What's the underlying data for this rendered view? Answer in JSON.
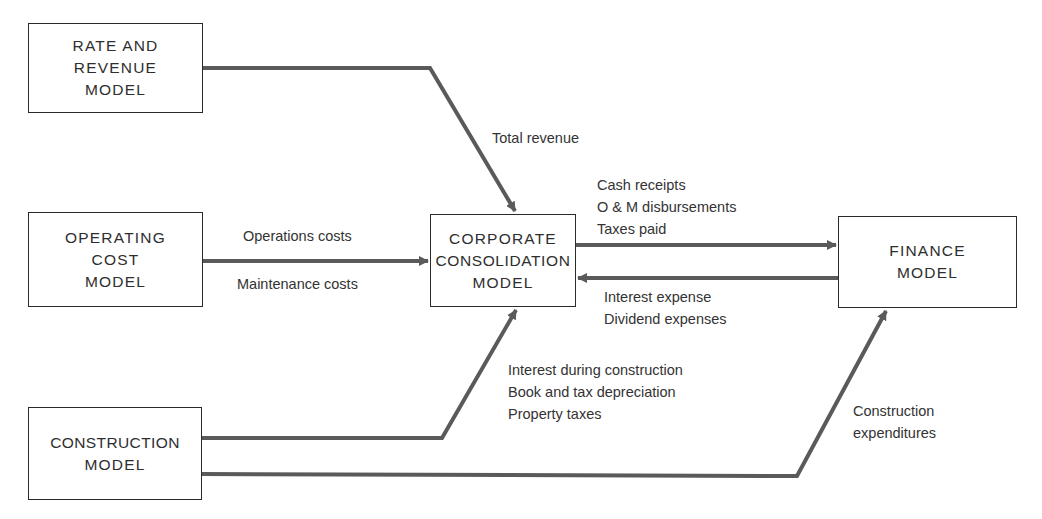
{
  "diagram": {
    "type": "flow",
    "nodes": [
      {
        "id": "rate_revenue",
        "lines": [
          "RATE AND",
          "REVENUE",
          "MODEL"
        ]
      },
      {
        "id": "operating_cost",
        "lines": [
          "OPERATING",
          "COST",
          "MODEL"
        ]
      },
      {
        "id": "corporate",
        "lines": [
          "CORPORATE",
          "CONSOLIDATION",
          "MODEL"
        ]
      },
      {
        "id": "finance",
        "lines": [
          "FINANCE",
          "MODEL"
        ]
      },
      {
        "id": "construction",
        "lines": [
          "CONSTRUCTION",
          "MODEL"
        ]
      }
    ],
    "edges": [
      {
        "from": "rate_revenue",
        "to": "corporate",
        "labels": [
          "Total revenue"
        ]
      },
      {
        "from": "operating_cost",
        "to": "corporate",
        "labels": [
          "Operations costs",
          "Maintenance costs"
        ]
      },
      {
        "from": "corporate",
        "to": "finance",
        "labels": [
          "Cash receipts",
          "O & M disbursements",
          "Taxes paid"
        ]
      },
      {
        "from": "finance",
        "to": "corporate",
        "labels": [
          "Interest expense",
          "Dividend expenses"
        ]
      },
      {
        "from": "construction",
        "to": "corporate",
        "labels": [
          "Interest during construction",
          "Book and tax depreciation",
          "Property taxes"
        ]
      },
      {
        "from": "construction",
        "to": "finance",
        "labels": [
          "Construction",
          "expenditures"
        ]
      }
    ]
  },
  "colors": {
    "line": "#5a5a5a",
    "border": "#2b2b2b",
    "text": "#2e2e2e"
  }
}
